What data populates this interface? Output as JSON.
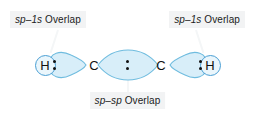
{
  "figure": {
    "background_color": "#ffffff"
  },
  "labels": {
    "left": {
      "text": "sp–1s Overlap",
      "italic_part": "sp",
      "separator": "–",
      "second_part": "1s",
      "word": "Overlap",
      "background_color": "#f2f3f4",
      "text_color": "#1b1b1b"
    },
    "right": {
      "text": "sp–1s Overlap",
      "italic_part": "sp",
      "separator": "–",
      "second_part": "1s",
      "word": "Overlap",
      "background_color": "#f2f3f4",
      "text_color": "#1b1b1b"
    },
    "bottom": {
      "text": "sp–sp Overlap",
      "italic_part": "sp",
      "separator": "–",
      "second_part": "sp",
      "word": "Overlap",
      "background_color": "#f2f3f4",
      "text_color": "#1b1b1b"
    }
  },
  "molecule": {
    "formula": "C2H2",
    "atoms": [
      {
        "symbol": "H",
        "style": "circled",
        "position": 1
      },
      {
        "symbol": "C",
        "style": "plain",
        "position": 2
      },
      {
        "symbol": "C",
        "style": "plain",
        "position": 3
      },
      {
        "symbol": "H",
        "style": "circled",
        "position": 4
      }
    ],
    "bonds": [
      {
        "name": "sp-1s",
        "between": [
          "H",
          "C"
        ],
        "electron_dots": 2,
        "shape": "lobe"
      },
      {
        "name": "sp-sp",
        "between": [
          "C",
          "C"
        ],
        "electron_dots": 2,
        "shape": "lens"
      },
      {
        "name": "sp-1s",
        "between": [
          "C",
          "H"
        ],
        "electron_dots": 2,
        "shape": "lobe"
      }
    ]
  },
  "colors": {
    "orbital_fill_light": "#eaf6fc",
    "orbital_fill_mid": "#cfeaf7",
    "orbital_stroke": "#6fbcdf",
    "atom_circle_stroke": "#4a9fd4",
    "atom_text": "#111111",
    "dot_color": "#111111",
    "leader_line": "#f4f6f7"
  }
}
